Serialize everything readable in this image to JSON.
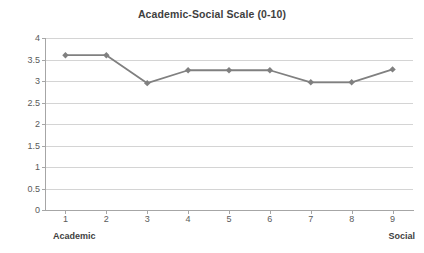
{
  "chart_data": {
    "type": "line",
    "title": "Academic-Social Scale (0-10)",
    "xlabel": "",
    "ylabel": "Grade Point Average",
    "categories": [
      "1",
      "2",
      "3",
      "4",
      "5",
      "6",
      "7",
      "8",
      "9"
    ],
    "values": [
      3.6,
      3.6,
      2.95,
      3.25,
      3.25,
      3.25,
      2.97,
      2.97,
      3.27
    ],
    "series": [
      {
        "name": "Grade Point Average",
        "values": [
          3.6,
          3.6,
          2.95,
          3.25,
          3.25,
          3.25,
          2.97,
          2.97,
          3.27
        ]
      }
    ],
    "ylim": [
      0,
      4
    ],
    "yticks": [
      "0",
      "0.5",
      "1",
      "1.5",
      "2",
      "2.5",
      "3",
      "3.5",
      "4"
    ],
    "ytick_values": [
      0,
      0.5,
      1,
      1.5,
      2,
      2.5,
      3,
      3.5,
      4
    ],
    "xticks": [
      "1",
      "2",
      "3",
      "4",
      "5",
      "6",
      "7",
      "8",
      "9"
    ],
    "grid": "horizontal",
    "legend": "none",
    "annotations": [
      {
        "text": "Academic",
        "position": "below-x-axis-left"
      },
      {
        "text": "Social",
        "position": "below-x-axis-right"
      }
    ],
    "colors": {
      "line": "#808080",
      "marker": "#808080",
      "gridline": "#d4d4d4",
      "axis": "#a6a6a6",
      "text": "#3f3f3f",
      "tick_text": "#5a5a5a",
      "background": "#ffffff"
    },
    "marker_shape": "diamond"
  }
}
